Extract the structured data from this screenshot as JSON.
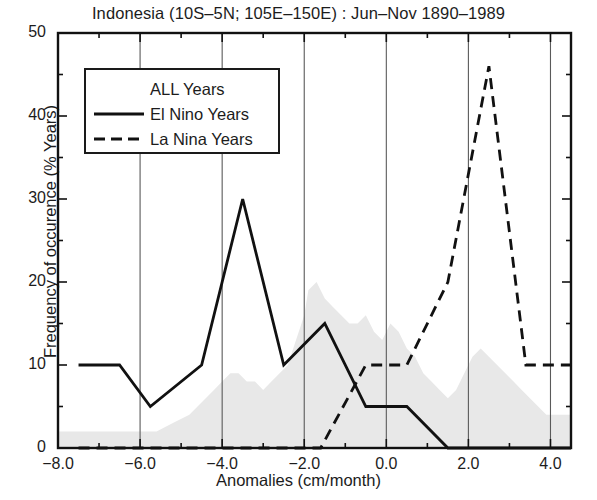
{
  "chart_data": {
    "type": "line",
    "title": "Indonesia (10S–5N; 105E–150E) : Jun–Nov 1890–1989",
    "xlabel": "Anomalies (cm/month)",
    "ylabel": "Frequency of occurence (% Years)",
    "xlim": [
      -8.0,
      4.5
    ],
    "ylim": [
      0,
      50
    ],
    "xticks": [
      -8.0,
      -6.0,
      -4.0,
      -2.0,
      0.0,
      2.0,
      4.0
    ],
    "xtick_labels": [
      "−8.0",
      "−6.0",
      "−4.0",
      "−2.0",
      "0.0",
      "2.0",
      "4.0"
    ],
    "yticks": [
      0,
      10,
      20,
      30,
      40,
      50
    ],
    "ytick_labels": [
      "0",
      "10",
      "20",
      "30",
      "40",
      "50"
    ],
    "minor_yticks": [
      5,
      15,
      25,
      35,
      45
    ],
    "minor_xticks": [
      -7.0,
      -5.0,
      -3.0,
      -1.0,
      1.0,
      3.0
    ],
    "grid": "vertical-major-only",
    "legend_position": "upper-left-inside",
    "series": [
      {
        "name": "ALL Years",
        "style": "filled-histogram",
        "fill_color": "#e8e8e8",
        "x": [
          -8.0,
          -7.6,
          -7.2,
          -6.8,
          -6.4,
          -6.0,
          -5.6,
          -5.2,
          -4.8,
          -4.4,
          -4.2,
          -4.0,
          -3.8,
          -3.6,
          -3.4,
          -3.2,
          -3.0,
          -2.8,
          -2.6,
          -2.4,
          -2.2,
          -2.0,
          -1.9,
          -1.7,
          -1.5,
          -1.3,
          -1.1,
          -0.9,
          -0.7,
          -0.5,
          -0.3,
          -0.1,
          0.1,
          0.3,
          0.5,
          0.7,
          0.9,
          1.1,
          1.3,
          1.5,
          1.7,
          1.9,
          2.1,
          2.3,
          2.5,
          2.7,
          2.9,
          3.1,
          3.3,
          3.5,
          3.7,
          3.9,
          4.1,
          4.3,
          4.5
        ],
        "y": [
          2,
          2,
          2,
          2,
          2,
          2,
          2,
          3,
          4,
          6,
          7,
          8,
          9,
          9,
          8,
          8,
          7,
          8,
          9,
          10,
          13,
          16,
          19,
          20,
          18,
          17,
          16,
          15,
          15,
          16,
          14,
          13,
          15,
          14,
          12,
          11,
          9,
          8,
          7,
          6,
          7,
          9,
          11,
          12,
          11,
          10,
          9,
          8,
          7,
          6,
          5,
          4,
          4,
          4,
          4
        ]
      },
      {
        "name": "El Nino Years",
        "style": "solid",
        "color": "#111111",
        "x": [
          -7.5,
          -6.5,
          -5.75,
          -4.5,
          -3.5,
          -2.5,
          -1.5,
          -0.5,
          0.5,
          1.5,
          4.5
        ],
        "y": [
          10,
          10,
          5,
          10,
          30,
          10,
          15,
          5,
          5,
          0,
          0
        ]
      },
      {
        "name": "La Nina Years",
        "style": "dashed",
        "color": "#111111",
        "x": [
          -7.5,
          -1.6,
          -0.5,
          0.5,
          1.5,
          2.5,
          3.4,
          4.5
        ],
        "y": [
          0,
          0,
          10,
          10,
          20,
          46,
          10,
          10
        ]
      }
    ]
  },
  "legend": {
    "entries": [
      {
        "label": "ALL Years",
        "marker": "none"
      },
      {
        "label": "El Nino Years",
        "marker": "solid-line"
      },
      {
        "label": "La Nina Years",
        "marker": "dashed-line"
      }
    ]
  }
}
